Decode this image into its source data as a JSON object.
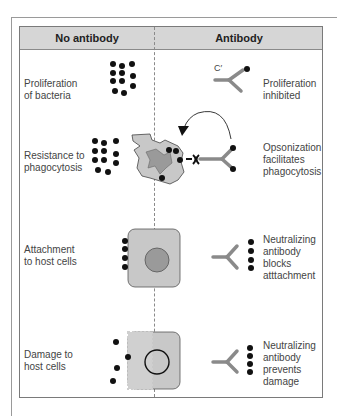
{
  "header": {
    "left": "No antibody",
    "right": "Antibody"
  },
  "rows": [
    {
      "left_label": [
        "Proliferation",
        "of bacteria"
      ],
      "right_label": [
        "Proliferation",
        "inhibited"
      ],
      "right_marker": "C′"
    },
    {
      "left_label": [
        "Resistance to",
        "phagocytosis"
      ],
      "right_label": [
        "Opsonization",
        "facilitates",
        "phagocytosis"
      ]
    },
    {
      "left_label": [
        "Attachment",
        "to host cells"
      ],
      "right_label": [
        "Neutralizing",
        "antibody",
        "blocks",
        "atttachment"
      ]
    },
    {
      "left_label": [
        "Damage to",
        "host cells"
      ],
      "right_label": [
        "Neutralizing",
        "antibody",
        "prevents",
        "damage"
      ]
    }
  ],
  "colors": {
    "header_fill": "#d6d6d6",
    "cell_fill": "#c8c8c8",
    "nucleus_fill": "#9a9a9a",
    "antibody": "#8a8a8a",
    "bacteria": "#111111"
  }
}
